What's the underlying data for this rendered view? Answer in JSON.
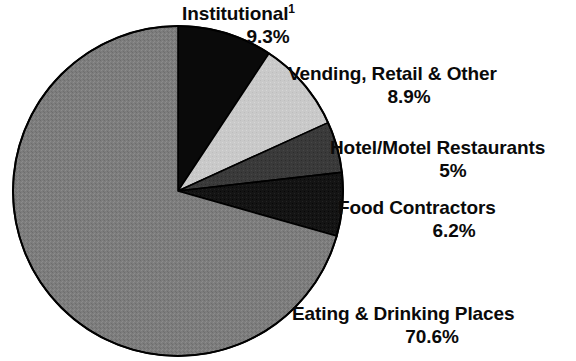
{
  "chart_data": {
    "type": "pie",
    "title": "",
    "subtitle": "",
    "xlabel": "",
    "ylabel": "",
    "legend_position": "callout-labels",
    "grid": false,
    "units": "percent",
    "start_angle_deg": 0,
    "direction": "clockwise",
    "categories": [
      "Institutional",
      "Vending, Retail & Other",
      "Hotel/Motel Restaurants",
      "Food Contractors",
      "Eating & Drinking Places"
    ],
    "values": [
      9.3,
      8.9,
      5.0,
      6.2,
      70.6
    ],
    "value_labels": [
      "9.3%",
      "8.9%",
      "5%",
      "6.2%",
      "70.6%"
    ],
    "colors": [
      "#0a0a0a",
      "#c9c9c9",
      "#3a3a3a",
      "#141414",
      "#7d7d7d"
    ],
    "annotations": [
      "1"
    ],
    "slices": [
      {
        "name": "Institutional",
        "label": "Institutional",
        "footnote": "1",
        "value": 9.3,
        "value_label": "9.3%",
        "color": "#0a0a0a"
      },
      {
        "name": "Vending, Retail & Other",
        "label": "Vending, Retail & Other",
        "footnote": "",
        "value": 8.9,
        "value_label": "8.9%",
        "color": "#c9c9c9"
      },
      {
        "name": "Hotel/Motel Restaurants",
        "label": "Hotel/Motel Restaurants",
        "footnote": "",
        "value": 5.0,
        "value_label": "5%",
        "color": "#3a3a3a"
      },
      {
        "name": "Food Contractors",
        "label": "Food Contractors",
        "footnote": "",
        "value": 6.2,
        "value_label": "6.2%",
        "color": "#141414"
      },
      {
        "name": "Eating & Drinking Places",
        "label": "Eating & Drinking Places",
        "footnote": "",
        "value": 70.6,
        "value_label": "70.6%",
        "color": "#7d7d7d"
      }
    ]
  },
  "labels": {
    "institutional": {
      "category": "Institutional",
      "footnote": "1",
      "percent": "9.3%"
    },
    "vending": {
      "category": "Vending, Retail & Other",
      "percent": "8.9%"
    },
    "hotel": {
      "category": "Hotel/Motel Restaurants",
      "percent": "5%"
    },
    "food": {
      "category": "Food Contractors",
      "percent": "6.2%"
    },
    "eating": {
      "category": "Eating & Drinking Places",
      "percent": "70.6%"
    }
  },
  "geometry": {
    "center_x": 178,
    "center_y": 191,
    "radius": 165
  },
  "style": {
    "background": "#ffffff",
    "text_color": "#0a0a0a",
    "outline_color": "#000000"
  }
}
